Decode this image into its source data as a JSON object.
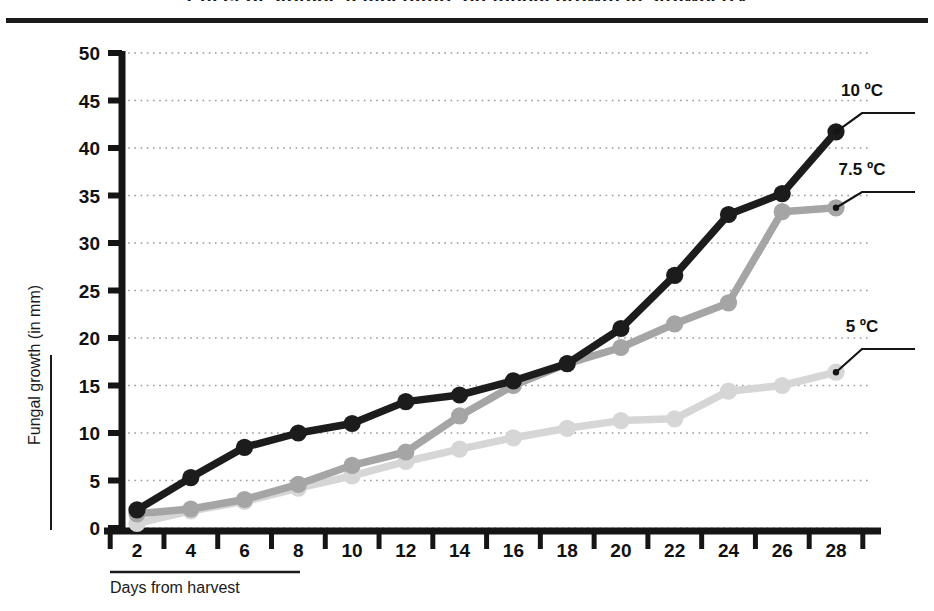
{
  "figure": {
    "title": "Effect of storage temperature on fungal growth in strawberry",
    "title_visible_fragment": "",
    "background_color": "#ffffff",
    "top_rule_color": "#1b1b1b"
  },
  "axes": {
    "y": {
      "label": "Fungal growth (in mm)",
      "ticks": [
        "0",
        "5",
        "10",
        "15",
        "20",
        "25",
        "30",
        "35",
        "40",
        "45",
        "50"
      ],
      "min": 0,
      "max": 50,
      "step": 5,
      "gridlines": true,
      "grid_style": "dotted",
      "grid_color": "#9a9a9a"
    },
    "x": {
      "label": "Days from harvest",
      "ticks": [
        "2",
        "4",
        "6",
        "8",
        "10",
        "12",
        "14",
        "16",
        "18",
        "20",
        "22",
        "24",
        "26",
        "28"
      ],
      "min": 2,
      "max": 28,
      "step": 2,
      "gridlines": false
    },
    "axis_color": "#151515"
  },
  "legend": {
    "position": "right-inline-leader-lines",
    "entries": [
      {
        "label": "10 ºC",
        "color": "#1c1c1c"
      },
      {
        "label": "7.5 ºC",
        "color": "#a5a5a5"
      },
      {
        "label": "5 ºC",
        "color": "#d6d6d6"
      }
    ]
  },
  "chart_data": {
    "type": "line",
    "title": "Effect of storage temperature on fungal growth in strawberry",
    "xlabel": "Days from harvest",
    "ylabel": "Fungal growth (in mm)",
    "xlim": [
      2,
      28
    ],
    "ylim": [
      0,
      50
    ],
    "yticks": [
      0,
      5,
      10,
      15,
      20,
      25,
      30,
      35,
      40,
      45,
      50
    ],
    "xticks": [
      2,
      4,
      6,
      8,
      10,
      12,
      14,
      16,
      18,
      20,
      22,
      24,
      26,
      28
    ],
    "grid": true,
    "legend_position": "right",
    "x": [
      2,
      4,
      6,
      8,
      10,
      12,
      14,
      16,
      18,
      20,
      22,
      24,
      26,
      28
    ],
    "series": [
      {
        "name": "10 ºC",
        "color": "#1c1c1c",
        "marker": "circle",
        "values": [
          1.9,
          5.3,
          8.5,
          10.0,
          11.0,
          13.3,
          14.0,
          15.5,
          17.3,
          21.0,
          26.6,
          33.0,
          35.2,
          41.7
        ]
      },
      {
        "name": "7.5 ºC",
        "color": "#a5a5a5",
        "marker": "circle",
        "values": [
          1.5,
          2.0,
          3.0,
          4.6,
          6.6,
          8.0,
          11.8,
          15.0,
          17.3,
          19.0,
          21.5,
          23.7,
          33.3,
          33.7
        ]
      },
      {
        "name": "5 ºC",
        "color": "#d6d6d6",
        "marker": "circle",
        "values": [
          0.5,
          1.8,
          2.8,
          4.2,
          5.5,
          7.0,
          8.3,
          9.5,
          10.5,
          11.3,
          11.5,
          14.4,
          15.0,
          16.4
        ]
      }
    ]
  }
}
